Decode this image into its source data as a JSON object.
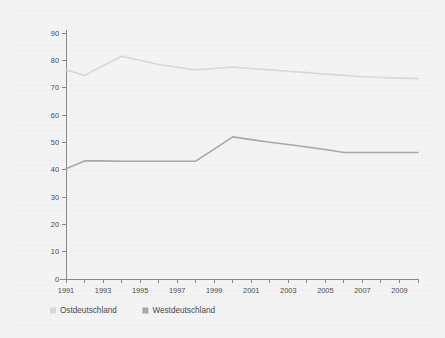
{
  "title": "",
  "legend": {
    "position": "bottom-left",
    "entries": [
      {
        "label": "Ostdeutschland",
        "color": "#d8d8d8"
      },
      {
        "label": "Westdeutschland",
        "color": "#a8a8a8"
      }
    ]
  },
  "axes": {
    "y_ticks": [
      "0",
      "10",
      "20",
      "30",
      "40",
      "50",
      "60",
      "70",
      "80",
      "90"
    ],
    "x_ticks_labeled": [
      "1991",
      "1993",
      "1995",
      "1997",
      "1999",
      "2001",
      "2003",
      "2005",
      "2007",
      "2009"
    ],
    "x_ticks_all": [
      "1991",
      "1992",
      "1993",
      "1994",
      "1995",
      "1996",
      "1997",
      "1998",
      "1999",
      "2000",
      "2001",
      "2002",
      "2003",
      "2004",
      "2005",
      "2006",
      "2007",
      "2008",
      "2009",
      "2010"
    ]
  },
  "colors": {
    "background": "#f4f4f4",
    "axis": "#8a8a8a",
    "text": "#4a4a4a",
    "ostdeutschland": "#d8d8d8",
    "westdeutschland": "#a8a8a8"
  },
  "chart_data": {
    "type": "line",
    "title": "",
    "xlabel": "",
    "ylabel": "",
    "xlim": [
      1991,
      2010
    ],
    "ylim": [
      0,
      90
    ],
    "grid": false,
    "legend_position": "bottom-left",
    "x": [
      1991,
      1992,
      1993,
      1994,
      1995,
      1996,
      1997,
      1998,
      1999,
      2000,
      2001,
      2002,
      2003,
      2004,
      2005,
      2006,
      2007,
      2008,
      2009,
      2010
    ],
    "series": [
      {
        "name": "Ostdeutschland",
        "color": "#d8d8d8",
        "values": [
          76.5,
          74.5,
          78.0,
          81.5,
          80.0,
          78.5,
          77.5,
          76.5,
          77.0,
          77.5,
          77.0,
          76.5,
          76.0,
          75.5,
          75.0,
          74.5,
          74.0,
          73.7,
          73.5,
          73.3
        ]
      },
      {
        "name": "Westdeutschland",
        "color": "#a8a8a8",
        "values": [
          40.3,
          43.2,
          43.2,
          43.1,
          43.1,
          43.1,
          43.1,
          43.1,
          47.5,
          52.0,
          51.0,
          50.0,
          49.2,
          48.3,
          47.4,
          46.3,
          46.3,
          46.3,
          46.3,
          46.3
        ]
      }
    ]
  }
}
